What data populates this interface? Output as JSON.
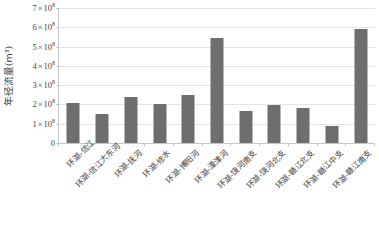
{
  "chart_data": {
    "type": "bar",
    "title": "",
    "xlabel": "",
    "ylabel": "年径流量(m³)",
    "ylim": [
      0,
      700000000
    ],
    "ytick_values": [
      0,
      100000000,
      200000000,
      300000000,
      400000000,
      500000000,
      600000000,
      700000000
    ],
    "ytick_labels": [
      "0",
      "1 × 10⁸",
      "2 × 10⁸",
      "3 × 10⁸",
      "4 × 10⁸",
      "5 × 10⁸",
      "6 × 10⁸",
      "7 × 10⁸"
    ],
    "ytick_mantissas": [
      "0",
      "1",
      "2",
      "3",
      "4",
      "5",
      "6",
      "7"
    ],
    "exponent": "8",
    "grid": true,
    "legend": "none",
    "bar_color": "#6e6e6e",
    "categories": [
      "环湖-信江",
      "环湖-信江大东河",
      "环湖-抚河",
      "环湖-修水",
      "环湖-博阳河",
      "环湖-潼津河",
      "环湖-饶河南支",
      "环湖-饶河北支",
      "环湖-赣江北支",
      "环湖-赣江中支",
      "环湖-赣江南支"
    ],
    "values": [
      210000000,
      150000000,
      240000000,
      200000000,
      250000000,
      545000000,
      165000000,
      195000000,
      180000000,
      88000000,
      590000000
    ],
    "values_scaled": [
      2.1,
      1.5,
      2.4,
      2.0,
      2.5,
      5.45,
      1.65,
      1.95,
      1.8,
      0.88,
      5.9
    ]
  },
  "axis": {
    "y_title": "年径流量(m³)"
  }
}
